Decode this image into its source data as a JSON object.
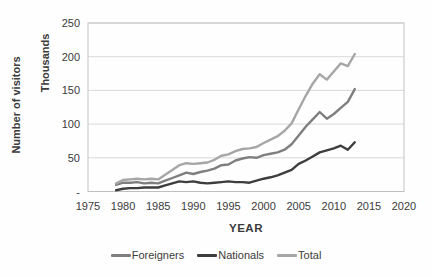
{
  "axis": {
    "y_title": "Number of visitors",
    "y_units": "Thousands",
    "x_title": "YEAR",
    "y_ticks": [
      "250",
      "200",
      "150",
      "100",
      "50",
      "-"
    ],
    "y_tick_values": [
      250,
      200,
      150,
      100,
      50,
      0
    ],
    "x_ticks": [
      "1975",
      "1980",
      "1985",
      "1990",
      "1995",
      "2000",
      "2005",
      "2010",
      "2015",
      "2020"
    ],
    "x_tick_values": [
      1975,
      1980,
      1985,
      1990,
      1995,
      2000,
      2005,
      2010,
      2015,
      2020
    ],
    "x_range": [
      1975,
      2020
    ],
    "y_range": [
      0,
      250
    ]
  },
  "colors": {
    "gridline": "#d9d9d9",
    "plot_border": "#c3c3c3",
    "axis_line": "#bfbfbf",
    "tick_text": "#3b3b3b"
  },
  "chart_data": {
    "type": "line",
    "title": "",
    "xlabel": "YEAR",
    "ylabel": "Number of visitors (Thousands)",
    "xlim": [
      1975,
      2020
    ],
    "ylim": [
      0,
      250
    ],
    "grid": "horizontal",
    "legend_position": "bottom",
    "x": [
      1979,
      1980,
      1981,
      1982,
      1983,
      1984,
      1985,
      1986,
      1987,
      1988,
      1989,
      1990,
      1991,
      1992,
      1993,
      1994,
      1995,
      1996,
      1997,
      1998,
      1999,
      2000,
      2001,
      2002,
      2003,
      2004,
      2005,
      2006,
      2007,
      2008,
      2009,
      2010,
      2011,
      2012,
      2013
    ],
    "series": [
      {
        "name": "Foreigners",
        "color": "#7f7f7f",
        "values": [
          10,
          13,
          13,
          14,
          12,
          13,
          12,
          16,
          20,
          24,
          28,
          26,
          29,
          31,
          34,
          39,
          40,
          46,
          49,
          51,
          50,
          54,
          56,
          58,
          62,
          70,
          83,
          96,
          107,
          118,
          108,
          115,
          124,
          133,
          152
        ]
      },
      {
        "name": "Nationals",
        "color": "#3d3d3d",
        "values": [
          2,
          4,
          5,
          5,
          6,
          6,
          6,
          9,
          12,
          15,
          14,
          15,
          13,
          12,
          13,
          14,
          15,
          14,
          14,
          13,
          16,
          19,
          21,
          24,
          28,
          32,
          41,
          46,
          52,
          58,
          61,
          64,
          68,
          62,
          73
        ]
      },
      {
        "name": "Total",
        "color": "#a6a6a6",
        "values": [
          12,
          17,
          18,
          19,
          18,
          19,
          18,
          25,
          32,
          39,
          42,
          41,
          42,
          43,
          47,
          53,
          55,
          60,
          63,
          64,
          66,
          72,
          77,
          82,
          90,
          101,
          122,
          142,
          160,
          174,
          166,
          178,
          190,
          186,
          204
        ]
      }
    ]
  }
}
